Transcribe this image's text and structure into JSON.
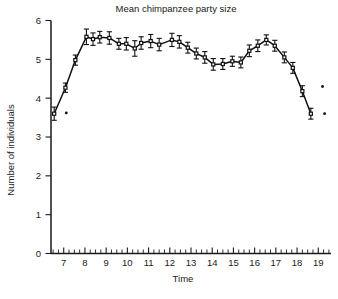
{
  "chart_data": {
    "type": "line",
    "title": "Mean chimpanzee party size",
    "xlabel": "Time",
    "ylabel": "Number of individuals",
    "xlim": [
      6.4,
      19.6
    ],
    "ylim": [
      0,
      6
    ],
    "grid": false,
    "legend": null,
    "x_tick_labels": [
      "7",
      "8",
      "9",
      "10",
      "11",
      "12",
      "13",
      "14",
      "15",
      "16",
      "17",
      "18",
      "19"
    ],
    "x_tick_values": [
      7,
      8,
      9,
      10,
      11,
      12,
      13,
      14,
      15,
      16,
      17,
      18,
      19
    ],
    "x_minor_tick_step": 0.25,
    "y_tick_labels": [
      "0",
      "1",
      "2",
      "3",
      "4",
      "5",
      "6"
    ],
    "y_tick_values": [
      0,
      1,
      2,
      3,
      4,
      5,
      6
    ],
    "marker": "open-square",
    "error_bars": "vertical",
    "x": [
      6.55,
      7.08,
      7.55,
      8.07,
      8.38,
      8.7,
      9.15,
      9.6,
      9.95,
      10.35,
      10.65,
      11.1,
      11.5,
      12.1,
      12.45,
      12.85,
      13.25,
      13.65,
      14.05,
      14.5,
      14.95,
      15.35,
      15.75,
      16.15,
      16.55,
      16.95,
      17.4,
      17.8,
      18.25,
      18.65
    ],
    "values": [
      3.6,
      4.27,
      4.98,
      5.58,
      5.52,
      5.57,
      5.55,
      5.4,
      5.4,
      5.28,
      5.42,
      5.47,
      5.38,
      5.5,
      5.45,
      5.3,
      5.15,
      5.05,
      4.87,
      4.88,
      4.95,
      4.92,
      5.22,
      5.35,
      5.5,
      5.35,
      5.05,
      4.78,
      4.18,
      3.6
    ],
    "errors": [
      0.17,
      0.12,
      0.13,
      0.2,
      0.16,
      0.15,
      0.16,
      0.14,
      0.16,
      0.2,
      0.16,
      0.17,
      0.16,
      0.17,
      0.16,
      0.14,
      0.14,
      0.15,
      0.15,
      0.14,
      0.13,
      0.14,
      0.15,
      0.15,
      0.13,
      0.14,
      0.14,
      0.14,
      0.14,
      0.14
    ],
    "stray_points": [
      {
        "x": 7.12,
        "y": 3.62
      },
      {
        "x": 19.2,
        "y": 4.3
      },
      {
        "x": 19.3,
        "y": 3.6
      }
    ],
    "colors": {
      "line": "#111111",
      "marker_fill": "#ffffff",
      "marker_stroke": "#111111",
      "axis": "#1a1a1a",
      "background": "#ffffff"
    }
  }
}
